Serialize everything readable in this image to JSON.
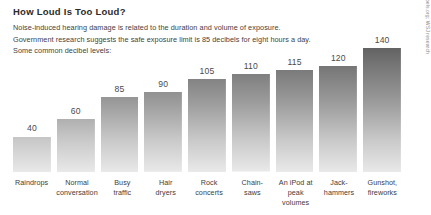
{
  "header": {
    "title": "How Loud Is Too Loud?",
    "deck_lines": [
      "Noise-induced hearing damage is related to the duration and volume of exposure.",
      "Government research suggests the safe exposure limit is 85 decibels for eight hours a day.",
      "Some common decibel levels:"
    ]
  },
  "source": "Sources: dangerousdecibels.org; WSJ research",
  "chart_data": {
    "type": "bar",
    "title": "How Loud Is Too Loud?",
    "xlabel": "",
    "ylabel": "Decibels",
    "ylim": [
      0,
      150
    ],
    "grid": false,
    "legend": false,
    "categories": [
      "Raindrops",
      "Normal conversation",
      "Busy traffic",
      "Hair dryers",
      "Rock concerts",
      "Chain-saws",
      "An iPod at peak volumes",
      "Jack-hammers",
      "Gunshot, fireworks"
    ],
    "category_lines": [
      [
        "Raindrops"
      ],
      [
        "Normal",
        "conversation"
      ],
      [
        "Busy",
        "traffic"
      ],
      [
        "Hair",
        "dryers"
      ],
      [
        "Rock",
        "concerts"
      ],
      [
        "Chain-",
        "saws"
      ],
      [
        "An iPod at",
        "peak volumes"
      ],
      [
        "Jack-",
        "hammers"
      ],
      [
        "Gunshot,",
        "fireworks"
      ]
    ],
    "values": [
      40,
      60,
      85,
      90,
      105,
      110,
      115,
      120,
      140
    ],
    "value_labels": [
      "40",
      "60",
      "85",
      "90",
      "105",
      "110",
      "115",
      "120",
      "140"
    ],
    "bar_gradient_top": "#4a4a4a",
    "bar_gradient_bottom": "#e9e9e9",
    "background": "#ffffff"
  }
}
